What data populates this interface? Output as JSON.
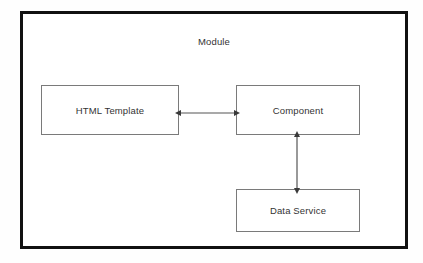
{
  "diagram": {
    "title": "Module",
    "background_color": "#ffffff",
    "frame_color": "#111111",
    "node_border_color": "#7a7a7a",
    "text_color": "#333333",
    "connector_color": "#555555",
    "nodes": [
      {
        "id": "html-template",
        "label": "HTML Template"
      },
      {
        "id": "component",
        "label": "Component"
      },
      {
        "id": "data-service",
        "label": "Data Service"
      }
    ],
    "connectors": [
      {
        "id": "template-component",
        "from": "html-template",
        "to": "component",
        "orientation": "horizontal",
        "arrowheads": "both"
      },
      {
        "id": "component-data-service",
        "from": "component",
        "to": "data-service",
        "orientation": "vertical",
        "arrowheads": "both"
      }
    ]
  }
}
